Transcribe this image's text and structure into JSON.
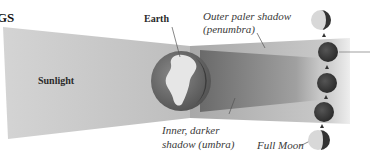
{
  "heading_fragment": "GS",
  "labels": {
    "earth": "Earth",
    "sunlight": "Sunlight",
    "penumbra_line1": "Outer paler shadow",
    "penumbra_line2": "(penumbra)",
    "umbra_line1": "Inner, darker",
    "umbra_line2": "shadow (umbra)",
    "full_moon": "Full Moon"
  },
  "colors": {
    "sunlight_beam": "#c8c8c8",
    "penumbra": "#b4b4b4",
    "umbra": "#8a8a8a",
    "earth_ocean": "#6e6e6e",
    "earth_land": "#e6e6e6",
    "moon_dark": "#3a3a3a",
    "moon_light": "#d8d8d8"
  },
  "moons": [
    {
      "phase": "partial",
      "cy": 20
    },
    {
      "phase": "eclipsed",
      "cy": 52
    },
    {
      "phase": "eclipsed",
      "cy": 83
    },
    {
      "phase": "eclipsed",
      "cy": 112
    },
    {
      "phase": "partial-full",
      "cy": 140
    }
  ]
}
